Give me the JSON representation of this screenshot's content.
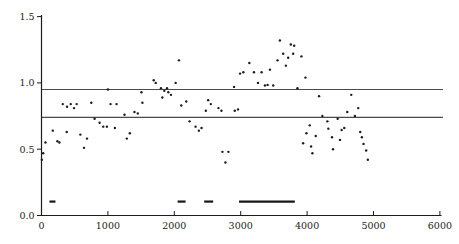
{
  "figure": {
    "background": "#ffffff",
    "width": 459,
    "height": 244
  },
  "chart_data": {
    "type": "scatter",
    "title": "",
    "subtitle": "",
    "xlabel": "",
    "ylabel": "",
    "legend": "none",
    "grid": false,
    "xlim": [
      0,
      6000
    ],
    "ylim": [
      0,
      1.5
    ],
    "x_tick_values": [
      0,
      1000,
      2000,
      3000,
      4000,
      5000,
      6000
    ],
    "x_tick_labels": [
      "0",
      "1000",
      "2000",
      "3000",
      "4000",
      "5000",
      "6000"
    ],
    "y_tick_values": [
      0.0,
      0.5,
      1.0,
      1.5
    ],
    "y_tick_labels": [
      "0.0",
      "0.5",
      "1.0",
      "1.5"
    ],
    "reference_lines": [
      {
        "y": 0.95
      },
      {
        "y": 0.74
      }
    ],
    "run_segments": {
      "y": 0.105,
      "x_ranges": [
        [
          120,
          210
        ],
        [
          2050,
          2170
        ],
        [
          2450,
          2585
        ],
        [
          2975,
          3815
        ]
      ]
    },
    "points": [
      [
        5,
        0.42
      ],
      [
        25,
        0.47
      ],
      [
        60,
        0.55
      ],
      [
        170,
        0.64
      ],
      [
        240,
        0.56
      ],
      [
        270,
        0.55
      ],
      [
        320,
        0.84
      ],
      [
        380,
        0.63
      ],
      [
        385,
        0.82
      ],
      [
        440,
        0.84
      ],
      [
        490,
        0.81
      ],
      [
        530,
        0.84
      ],
      [
        585,
        0.61
      ],
      [
        640,
        0.51
      ],
      [
        685,
        0.58
      ],
      [
        750,
        0.85
      ],
      [
        800,
        0.73
      ],
      [
        875,
        0.7
      ],
      [
        930,
        0.67
      ],
      [
        985,
        0.67
      ],
      [
        1000,
        0.95
      ],
      [
        1040,
        0.84
      ],
      [
        1105,
        0.66
      ],
      [
        1130,
        0.84
      ],
      [
        1250,
        0.76
      ],
      [
        1285,
        0.58
      ],
      [
        1330,
        0.62
      ],
      [
        1400,
        0.78
      ],
      [
        1450,
        0.77
      ],
      [
        1505,
        0.93
      ],
      [
        1520,
        0.85
      ],
      [
        1690,
        1.02
      ],
      [
        1720,
        1.0
      ],
      [
        1800,
        0.96
      ],
      [
        1820,
        0.89
      ],
      [
        1850,
        0.94
      ],
      [
        1890,
        0.96
      ],
      [
        1910,
        0.93
      ],
      [
        1950,
        0.91
      ],
      [
        2020,
        1.0
      ],
      [
        2070,
        1.17
      ],
      [
        2105,
        0.83
      ],
      [
        2180,
        0.86
      ],
      [
        2230,
        0.71
      ],
      [
        2320,
        0.67
      ],
      [
        2370,
        0.64
      ],
      [
        2410,
        0.66
      ],
      [
        2475,
        0.79
      ],
      [
        2510,
        0.87
      ],
      [
        2550,
        0.84
      ],
      [
        2665,
        0.81
      ],
      [
        2710,
        0.79
      ],
      [
        2725,
        0.48
      ],
      [
        2770,
        0.4
      ],
      [
        2815,
        0.48
      ],
      [
        2900,
        0.97
      ],
      [
        2910,
        0.79
      ],
      [
        2960,
        0.8
      ],
      [
        2990,
        1.07
      ],
      [
        3040,
        1.08
      ],
      [
        3130,
        1.15
      ],
      [
        3200,
        1.08
      ],
      [
        3260,
        1.0
      ],
      [
        3315,
        1.08
      ],
      [
        3365,
        0.98
      ],
      [
        3405,
        0.985
      ],
      [
        3440,
        1.1
      ],
      [
        3490,
        0.98
      ],
      [
        3555,
        1.17
      ],
      [
        3590,
        1.32
      ],
      [
        3640,
        1.22
      ],
      [
        3680,
        1.13
      ],
      [
        3715,
        1.19
      ],
      [
        3755,
        1.29
      ],
      [
        3790,
        1.22
      ],
      [
        3805,
        1.28
      ],
      [
        3855,
        0.96
      ],
      [
        3915,
        1.2
      ],
      [
        3975,
        1.04
      ],
      [
        3940,
        0.545
      ],
      [
        3990,
        0.62
      ],
      [
        4040,
        0.68
      ],
      [
        4060,
        0.52
      ],
      [
        4080,
        0.47
      ],
      [
        4130,
        0.6
      ],
      [
        4180,
        0.9
      ],
      [
        4230,
        0.75
      ],
      [
        4305,
        0.71
      ],
      [
        4320,
        0.655
      ],
      [
        4375,
        0.59
      ],
      [
        4390,
        0.5
      ],
      [
        4460,
        0.73
      ],
      [
        4495,
        0.57
      ],
      [
        4520,
        0.645
      ],
      [
        4560,
        0.66
      ],
      [
        4605,
        0.78
      ],
      [
        4665,
        0.91
      ],
      [
        4720,
        0.75
      ],
      [
        4770,
        0.81
      ],
      [
        4800,
        0.63
      ],
      [
        4825,
        0.59
      ],
      [
        4850,
        0.54
      ],
      [
        4890,
        0.49
      ],
      [
        4915,
        0.42
      ]
    ],
    "colors": {
      "marker": "#1c1c1c",
      "axis": "#1c1c1c",
      "tick_label": "#1c1c1c",
      "reference_line": "#4a4a4a",
      "segment": "#161616"
    },
    "marker_radius_px": 1.2
  }
}
